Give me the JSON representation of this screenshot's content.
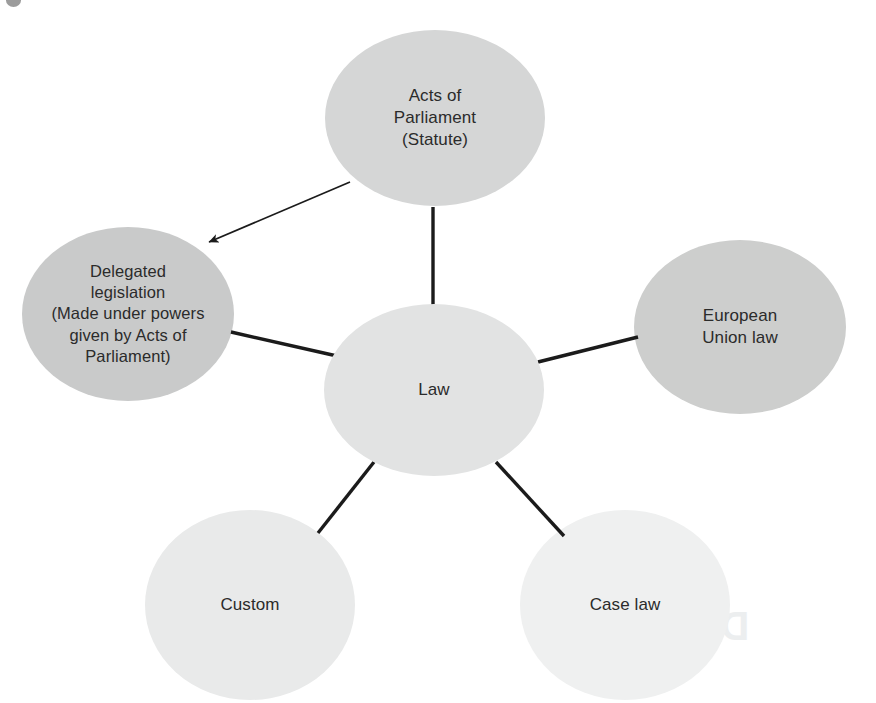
{
  "diagram": {
    "type": "spider-map",
    "central_node": {
      "id": "law",
      "label": "Law",
      "fill": "#e2e3e3",
      "cx": 434,
      "cy": 390,
      "rx": 110,
      "ry": 86
    },
    "nodes": [
      {
        "id": "acts-of-parliament",
        "label": "Acts of\nParliament\n(Statute)",
        "fill": "#d5d6d6",
        "cx": 435,
        "cy": 118,
        "rx": 110,
        "ry": 88,
        "text_class": "label-standard"
      },
      {
        "id": "delegated-legislation",
        "label": "Delegated\nlegislation\n(Made under powers\ngiven by Acts of\nParliament)",
        "fill": "#c9caca",
        "cx": 128,
        "cy": 314,
        "rx": 106,
        "ry": 87,
        "text_class": "label-dense"
      },
      {
        "id": "european-union-law",
        "label": "European\nUnion law",
        "fill": "#cdcecd",
        "cx": 740,
        "cy": 327,
        "rx": 106,
        "ry": 87,
        "text_class": "label-standard"
      },
      {
        "id": "custom",
        "label": "Custom",
        "fill": "#e9eaea",
        "cx": 250,
        "cy": 605,
        "rx": 105,
        "ry": 95,
        "text_class": "label-standard"
      },
      {
        "id": "case-law",
        "label": "Case law",
        "fill": "#eff0f0",
        "cx": 625,
        "cy": 605,
        "rx": 105,
        "ry": 95,
        "text_class": "label-standard"
      }
    ],
    "connectors": [
      {
        "id": "law-to-acts-of-parliament",
        "from": "law",
        "to": "acts-of-parliament",
        "x1": 433,
        "y1": 306,
        "x2": 433,
        "y2": 207,
        "arrow": false
      },
      {
        "id": "law-to-delegated-legislation",
        "from": "law",
        "to": "delegated-legislation",
        "x1": 337,
        "y1": 356,
        "x2": 231,
        "y2": 332,
        "arrow": false
      },
      {
        "id": "law-to-european-union-law",
        "from": "law",
        "to": "european-union-law",
        "x1": 538,
        "y1": 362,
        "x2": 638,
        "y2": 337,
        "arrow": false
      },
      {
        "id": "law-to-custom",
        "from": "law",
        "to": "custom",
        "x1": 374,
        "y1": 462,
        "x2": 318,
        "y2": 533,
        "arrow": false
      },
      {
        "id": "law-to-case-law",
        "from": "law",
        "to": "case-law",
        "x1": 496,
        "y1": 462,
        "x2": 564,
        "y2": 536,
        "arrow": false
      },
      {
        "id": "acts-of-parliament-to-delegated-legislation",
        "from": "acts-of-parliament",
        "to": "delegated-legislation",
        "x1": 350,
        "y1": 182,
        "x2": 207,
        "y2": 243,
        "arrow": true
      }
    ],
    "stroke_color": "#1b1b1b",
    "background": "#ffffff",
    "bleed_through_text": "Directives"
  }
}
